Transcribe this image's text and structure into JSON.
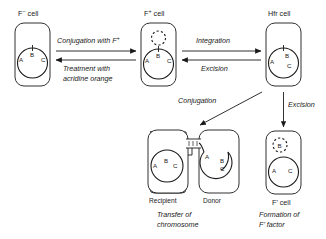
{
  "diagram": {
    "ink_color": "#1a1a1a",
    "background": "#ffffff"
  },
  "cells": {
    "f_minus": {
      "label": "F",
      "label_sup": "−",
      "label_suffix": " cell",
      "genes": [
        "A",
        "B",
        "C"
      ],
      "has_free_plasmid": false,
      "has_integrated_marker": true
    },
    "f_plus": {
      "label": "F",
      "label_sup": "+",
      "label_suffix": " cell",
      "genes": [
        "A",
        "B",
        "C"
      ],
      "has_free_plasmid": true,
      "plasmid_label": "",
      "has_integrated_marker": true
    },
    "hfr": {
      "label": "Hfr cell",
      "genes": [
        "A",
        "B",
        "C"
      ],
      "has_free_plasmid": false,
      "has_integrated_marker": true
    },
    "recipient": {
      "role": "Recipient",
      "genes": [
        "A",
        "B",
        "C"
      ]
    },
    "donor": {
      "role": "Donor",
      "genes": [
        "A",
        "B",
        "C"
      ]
    },
    "f_prime": {
      "label": "F' cell",
      "genes": [
        "A",
        "C"
      ],
      "plasmid_gene": "B",
      "has_free_plasmid": true
    }
  },
  "arrows": {
    "conjugation_with_f_plus": {
      "text": "Conjugation with F",
      "sup": "+",
      "direction": "right"
    },
    "acridine_orange": {
      "line1": "Treatment with",
      "line2": "acridine orange",
      "direction": "left"
    },
    "integration": {
      "text": "Integration",
      "direction": "right"
    },
    "excision_horizontal": {
      "text": "Excision",
      "direction": "left"
    },
    "conjugation_diagonal": {
      "text": "Conjugation",
      "direction": "down-left"
    },
    "excision_vertical": {
      "text": "Excision",
      "direction": "down"
    }
  },
  "captions": {
    "transfer": {
      "line1": "Transfer of",
      "line2": "chromosome"
    },
    "formation": {
      "line1": "Formation of",
      "line2": "F' factor"
    }
  }
}
